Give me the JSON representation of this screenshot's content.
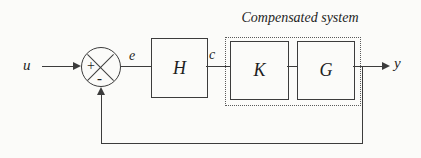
{
  "diagram": {
    "group_title": "Compensated system",
    "signals": {
      "input": "u",
      "error": "e",
      "control": "c",
      "output": "y"
    },
    "blocks": {
      "controller": "H",
      "compensator": "K",
      "plant": "G"
    },
    "summing_junction": {
      "plus": "+",
      "minus": "-"
    },
    "colors": {
      "line": "#3c3c3c",
      "background": "#fbfbf9"
    }
  }
}
